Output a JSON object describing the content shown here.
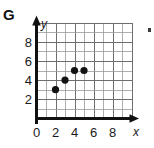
{
  "figure": {
    "part_label": "G",
    "x_axis_name": "x",
    "y_axis_name": "y"
  },
  "chart_data": {
    "type": "scatter",
    "title": "",
    "subtitle": "",
    "xlabel": "x",
    "ylabel": "y",
    "xlim": [
      0,
      10
    ],
    "ylim": [
      0,
      10
    ],
    "grid": true,
    "grid_step": 1,
    "legend": null,
    "x_tick_labels": [
      "0",
      "2",
      "4",
      "6",
      "8"
    ],
    "x_tick_values": [
      0,
      2,
      4,
      6,
      8
    ],
    "y_tick_labels": [
      "2",
      "4",
      "6",
      "8"
    ],
    "y_tick_values": [
      2,
      4,
      6,
      8
    ],
    "points": [
      {
        "x": 2,
        "y": 3
      },
      {
        "x": 3,
        "y": 4
      },
      {
        "x": 4,
        "y": 5
      },
      {
        "x": 5,
        "y": 5
      }
    ],
    "point_color": "#121212",
    "grid_color": "#9a9a9a",
    "axis_color": "#111111"
  }
}
